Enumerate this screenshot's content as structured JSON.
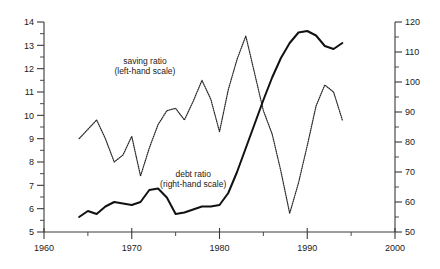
{
  "chart_data": {
    "type": "line",
    "title": "",
    "subtitle": "",
    "xlabel": "",
    "ylabel": "",
    "grid": false,
    "legend_position": "inline-annotation",
    "xlim": [
      1960,
      2000
    ],
    "x_ticks_major": [
      1960,
      1970,
      1980,
      1990,
      2000
    ],
    "x_ticks_minor": [
      1965,
      1975,
      1985,
      1995
    ],
    "y_left_label": "saving ratio (left-hand scale)",
    "ylim_left": [
      5,
      14
    ],
    "y_left_ticks_major": [
      5,
      6,
      7,
      8,
      9,
      10,
      11,
      12,
      13,
      14
    ],
    "y_left_ticks_minor": [
      5.5,
      6.5,
      7.5,
      8.5,
      9.5,
      10.5,
      11.5,
      12.5,
      13.5
    ],
    "y_right_label": "debt ratio (right-hand scale)",
    "ylim_right": [
      50,
      120
    ],
    "y_right_ticks_major": [
      50,
      60,
      70,
      80,
      90,
      100,
      110,
      120
    ],
    "y_right_ticks_minor": [
      55,
      65,
      75,
      85,
      95,
      105,
      115
    ],
    "series": [
      {
        "name": "saving ratio",
        "axis": "left",
        "style": "dotted",
        "x": [
          1964,
          1965,
          1966,
          1967,
          1968,
          1969,
          1970,
          1971,
          1972,
          1973,
          1974,
          1975,
          1976,
          1977,
          1978,
          1979,
          1980,
          1981,
          1982,
          1983,
          1984,
          1985,
          1986,
          1987,
          1988,
          1989,
          1990,
          1991,
          1992,
          1993,
          1994
        ],
        "y": [
          9.0,
          9.4,
          9.8,
          9.0,
          8.0,
          8.3,
          9.1,
          7.4,
          8.6,
          9.6,
          10.2,
          10.3,
          9.8,
          10.6,
          11.5,
          10.7,
          9.3,
          11.1,
          12.4,
          13.4,
          11.8,
          10.2,
          9.2,
          7.6,
          5.8,
          7.1,
          8.7,
          10.4,
          11.3,
          11.0,
          9.8
        ]
      },
      {
        "name": "debt ratio",
        "axis": "right",
        "style": "solid",
        "x": [
          1964,
          1965,
          1966,
          1967,
          1968,
          1969,
          1970,
          1971,
          1972,
          1973,
          1974,
          1975,
          1976,
          1977,
          1978,
          1979,
          1980,
          1981,
          1982,
          1983,
          1984,
          1985,
          1986,
          1987,
          1988,
          1989,
          1990,
          1991,
          1992,
          1993,
          1994
        ],
        "y": [
          55.0,
          57.0,
          56.0,
          58.5,
          60.0,
          59.5,
          59.0,
          60.0,
          64.0,
          64.5,
          61.5,
          56.0,
          56.5,
          57.5,
          58.5,
          58.5,
          59.0,
          63.0,
          70.0,
          78.0,
          86.0,
          94.0,
          101.5,
          108.0,
          113.0,
          116.5,
          117.0,
          115.5,
          112.0,
          111.0,
          113.0
        ]
      }
    ],
    "annotations": [
      {
        "id": "saving-annotation",
        "line1": "saving ratio",
        "line2": "(left-hand scale)",
        "x": 1971.5,
        "y_left": 12.2
      },
      {
        "id": "debt-annotation",
        "line1": "debt ratio",
        "line2": "(right-hand scale)",
        "x": 1977.0,
        "y_left": 7.35
      }
    ]
  }
}
